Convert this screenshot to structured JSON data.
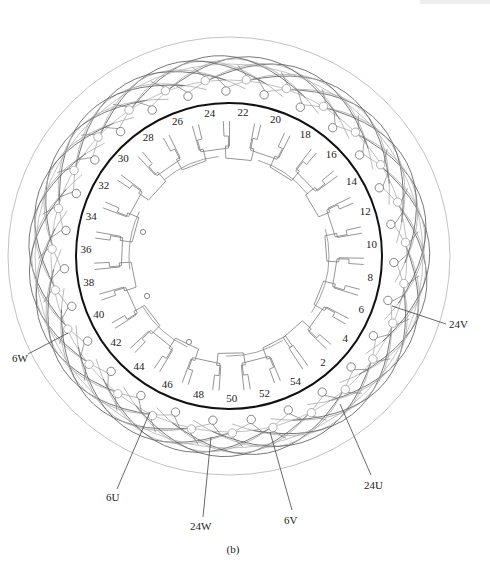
{
  "figure": {
    "caption": "(b)",
    "center": {
      "x": 229,
      "y": 256
    },
    "colors": {
      "stator_ring": "#111111",
      "coil_dark": "#555555",
      "coil_light": "#a8a8a8",
      "teeth": "#7a7a7a",
      "terminal": "#777777",
      "text": "#222222"
    },
    "geometry": {
      "stator_radius": 153,
      "label_radius": 143,
      "slot_count": 54,
      "label_start_slot": 22,
      "label_start_angle_deg": -84.4,
      "outer_envelope_rx": 221,
      "outer_envelope_ry": 219,
      "bore_radius": 92
    },
    "slot_labels": [
      "2",
      "4",
      "6",
      "8",
      "10",
      "12",
      "14",
      "16",
      "18",
      "20",
      "22",
      "24",
      "26",
      "28",
      "30",
      "32",
      "34",
      "36",
      "38",
      "40",
      "42",
      "44",
      "46",
      "48",
      "50",
      "52",
      "54"
    ],
    "lead_labels": [
      {
        "id": "24V",
        "text": "24V",
        "x": 449,
        "y": 328,
        "from": {
          "x": 392,
          "y": 306
        },
        "anchor": {
          "x": 446,
          "y": 324
        }
      },
      {
        "id": "6W",
        "text": "6W",
        "x": 12,
        "y": 362,
        "from": {
          "x": 68,
          "y": 333
        },
        "anchor": {
          "x": 28,
          "y": 354
        }
      },
      {
        "id": "6U",
        "text": "6U",
        "x": 106,
        "y": 501,
        "from": {
          "x": 150,
          "y": 412
        },
        "anchor": {
          "x": 117,
          "y": 489
        }
      },
      {
        "id": "24W",
        "text": "24W",
        "x": 190,
        "y": 530,
        "from": {
          "x": 211,
          "y": 437
        },
        "anchor": {
          "x": 203,
          "y": 517
        }
      },
      {
        "id": "6V",
        "text": "6V",
        "x": 284,
        "y": 524,
        "from": {
          "x": 270,
          "y": 432
        },
        "anchor": {
          "x": 292,
          "y": 510
        }
      },
      {
        "id": "24U",
        "text": "24U",
        "x": 364,
        "y": 489,
        "from": {
          "x": 340,
          "y": 404
        },
        "anchor": {
          "x": 371,
          "y": 475
        }
      }
    ],
    "inner_markers": [
      {
        "x": 143,
        "y": 232
      },
      {
        "x": 147,
        "y": 296
      },
      {
        "x": 189,
        "y": 342
      }
    ]
  }
}
